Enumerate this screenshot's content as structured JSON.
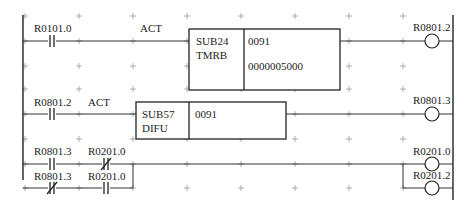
{
  "diagram": {
    "type": "ladder",
    "rungs": [
      {
        "contacts": [
          {
            "address": "R0101.0",
            "type": "NO"
          }
        ],
        "act_label": "ACT",
        "function_block": {
          "sub": "SUB24",
          "name": "TMRB",
          "params": [
            "0091",
            "0000005000"
          ]
        },
        "coils": [
          {
            "address": "R0801.2"
          }
        ]
      },
      {
        "contacts": [
          {
            "address": "R0801.2",
            "type": "NO"
          }
        ],
        "act_label": "ACT",
        "function_block": {
          "sub": "SUB57",
          "name": "DIFU",
          "params": [
            "0091"
          ]
        },
        "coils": [
          {
            "address": "R0801.3"
          }
        ]
      },
      {
        "branches": [
          {
            "contacts": [
              {
                "address": "R0801.3",
                "type": "NO"
              },
              {
                "address": "R0201.0",
                "type": "NC"
              }
            ]
          },
          {
            "contacts": [
              {
                "address": "R0801.3",
                "type": "NC"
              },
              {
                "address": "R0201.0",
                "type": "NO"
              }
            ]
          }
        ],
        "coils": [
          {
            "address": "R0201.0"
          },
          {
            "address": "R0201.2"
          }
        ]
      }
    ]
  }
}
